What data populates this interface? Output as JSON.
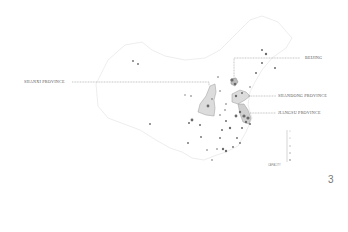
{
  "map": {
    "title": "",
    "labels": [
      {
        "id": "beijing",
        "text": "BEIJING"
      },
      {
        "id": "shanxi",
        "text": "SHANXI PROVINCE"
      },
      {
        "id": "shandong",
        "text": "SHANDONG PROVINCE"
      },
      {
        "id": "jiangsu",
        "text": "JIANGSU PROVINCE"
      }
    ],
    "legend": {
      "caption": "CAPACITY",
      "ticks": [
        "1",
        "2",
        "3",
        "4",
        "5"
      ]
    },
    "colors": {
      "outline": "#e6e6e6",
      "province_fill": "#d9d9d9",
      "province_stroke": "#9a9a9a",
      "marker": "#666666",
      "leader_line": "#8a8a8a"
    }
  },
  "page": {
    "number": "3"
  }
}
